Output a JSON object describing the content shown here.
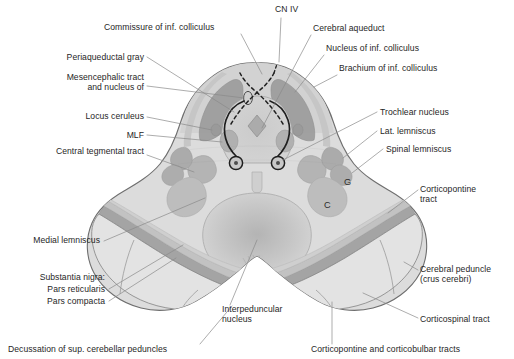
{
  "figure": {
    "type": "anatomical-cross-section",
    "palette": {
      "background": "#ffffff",
      "outline": "#6e6e6e",
      "tegmentum_fill": "#d9d9d9",
      "tectum_fill": "#cfcfcf",
      "peduncle_fill": "#e2e2e2",
      "periaqueductal_gray": "#cdcdcd",
      "nucleus_dark": "#9c9c9c",
      "nucleus_mid": "#b2b2b2",
      "nucleus_light": "#c3c3c3",
      "substantia_nigra_compacta": "#a6a6a6",
      "label_text": "#262626",
      "leader_line": "#8a8a8a",
      "dashed_fiber": "#1f1f1f"
    }
  },
  "labels": {
    "top": [
      {
        "id": "commissure-inf-colliculus",
        "text": "Commissure of inf. colliculus",
        "x": 104,
        "y": 28,
        "align": "left"
      },
      {
        "id": "cn-iv",
        "text": "CN IV",
        "x": 275,
        "y": 10,
        "align": "left"
      },
      {
        "id": "cerebral-aqueduct",
        "text": "Cerebral aqueduct",
        "x": 313,
        "y": 29,
        "align": "left"
      },
      {
        "id": "nucleus-inf-colliculus",
        "text": "Nucleus of inf. colliculus",
        "x": 326,
        "y": 49,
        "align": "left"
      },
      {
        "id": "brachium-inf-colliculus",
        "text": "Brachium of inf. colliculus",
        "x": 339,
        "y": 69,
        "align": "left"
      }
    ],
    "left": [
      {
        "id": "periaqueductal-gray",
        "text": "Periaqueductal gray",
        "x": 144,
        "y": 58,
        "align": "right"
      },
      {
        "id": "mesencephalic-tract",
        "text": "Mesencephalic tract\nand nucleus of",
        "x": 144,
        "y": 78,
        "align": "right"
      },
      {
        "id": "locus-ceruleus",
        "text": "Locus ceruleus",
        "x": 144,
        "y": 117,
        "align": "right"
      },
      {
        "id": "mlf",
        "text": "MLF",
        "x": 144,
        "y": 136,
        "align": "right"
      },
      {
        "id": "central-tegmental-tract",
        "text": "Central tegmental tract",
        "x": 144,
        "y": 152,
        "align": "right"
      },
      {
        "id": "medial-lemniscus",
        "text": "Medial lemniscus",
        "x": 100,
        "y": 241,
        "align": "right"
      },
      {
        "id": "substantia-nigra",
        "text": "Substantia nigra:",
        "x": 105,
        "y": 278,
        "align": "right"
      },
      {
        "id": "pars-reticularis",
        "text": "Pars reticularis",
        "x": 105,
        "y": 290,
        "align": "right"
      },
      {
        "id": "pars-compacta",
        "text": "Pars compacta",
        "x": 105,
        "y": 302,
        "align": "right"
      }
    ],
    "right": [
      {
        "id": "trochlear-nucleus",
        "text": "Trochlear nucleus",
        "x": 380,
        "y": 113,
        "align": "left"
      },
      {
        "id": "lat-lemniscus",
        "text": "Lat. lemniscus",
        "x": 380,
        "y": 132,
        "align": "left"
      },
      {
        "id": "spinal-lemniscus",
        "text": "Spinal lemniscus",
        "x": 386,
        "y": 150,
        "align": "left"
      },
      {
        "id": "corticopontine-tract",
        "text": "Corticopontine\ntract",
        "x": 420,
        "y": 190,
        "align": "left"
      },
      {
        "id": "cerebral-peduncle",
        "text": "Cerebral peduncle\n(crus cerebri)",
        "x": 420,
        "y": 270,
        "align": "left"
      },
      {
        "id": "corticospinal-tract",
        "text": "Corticospinal tract",
        "x": 420,
        "y": 320,
        "align": "left"
      }
    ],
    "bottom": [
      {
        "id": "interpeduncular-nucleus",
        "text": "Interpeduncular\nnucleus",
        "x": 222,
        "y": 310,
        "align": "left"
      },
      {
        "id": "decussation-scp",
        "text": "Decussation of sup. cerebellar peduncles",
        "x": 8,
        "y": 350,
        "align": "left"
      },
      {
        "id": "corticopontine-corticobulbar",
        "text": "Corticopontine and corticobulbar tracts",
        "x": 311,
        "y": 350,
        "align": "left"
      }
    ],
    "in_figure": [
      {
        "id": "marker-g",
        "text": "G",
        "x": 344,
        "y": 183
      },
      {
        "id": "marker-c",
        "text": "C",
        "x": 324,
        "y": 206
      }
    ]
  }
}
